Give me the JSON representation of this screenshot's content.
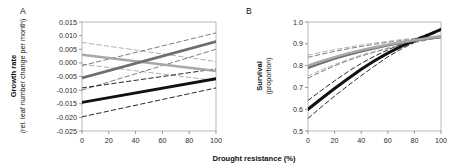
{
  "figure": {
    "width": 454,
    "height": 166,
    "background": "#ffffff",
    "shared_xlabel": "Drought resistance (%)"
  },
  "chart_data": [
    {
      "type": "line",
      "panel": "A",
      "panel_label": "A",
      "title": "",
      "xlabel": "Drought resistance (%)",
      "ylabel": "Growth rate",
      "ylabel_sub": "(rel. leaf number change per month)",
      "xlim": [
        0,
        100
      ],
      "ylim": [
        -0.025,
        0.015
      ],
      "xticks": [
        0,
        20,
        40,
        60,
        80,
        100
      ],
      "yticks": [
        0.015,
        0.01,
        0.005,
        0.0,
        -0.005,
        -0.01,
        -0.015,
        -0.02,
        -0.025
      ],
      "ytick_labels": [
        "0.015",
        "0.010",
        "0.005",
        "0.000",
        "-0.005",
        "-0.010",
        "-0.015",
        "-0.020",
        "-0.025"
      ],
      "xtick_labels": [
        "0",
        "20",
        "40",
        "60",
        "80",
        "100"
      ],
      "grid": false,
      "legend": "none",
      "series": [
        {
          "name": "light-gray-declining",
          "color": "#a8a8a8",
          "style": "solid",
          "width": 2.6,
          "x": [
            0,
            100
          ],
          "values": [
            0.003,
            -0.003
          ]
        },
        {
          "name": "light-gray-ci-upper",
          "color": "#a8a8a8",
          "style": "dashed",
          "width": 0.9,
          "x": [
            0,
            100
          ],
          "values": [
            0.0075,
            0.0005
          ]
        },
        {
          "name": "light-gray-ci-lower",
          "color": "#a8a8a8",
          "style": "dashed",
          "width": 0.9,
          "x": [
            0,
            100
          ],
          "values": [
            -0.0005,
            -0.0065
          ]
        },
        {
          "name": "mid-gray-rising",
          "color": "#6e6e6e",
          "style": "solid",
          "width": 2.8,
          "x": [
            0,
            100
          ],
          "values": [
            -0.0055,
            0.0078
          ]
        },
        {
          "name": "mid-gray-ci-upper",
          "color": "#6e6e6e",
          "style": "dashed",
          "width": 0.9,
          "x": [
            0,
            100
          ],
          "values": [
            -0.001,
            0.011
          ]
        },
        {
          "name": "mid-gray-ci-lower",
          "color": "#6e6e6e",
          "style": "dashed",
          "width": 0.9,
          "x": [
            0,
            100
          ],
          "values": [
            -0.01,
            0.005
          ]
        },
        {
          "name": "black-rising",
          "color": "#111111",
          "style": "solid",
          "width": 2.9,
          "x": [
            0,
            100
          ],
          "values": [
            -0.0145,
            -0.0058
          ]
        },
        {
          "name": "black-ci-upper",
          "color": "#111111",
          "style": "dashed",
          "width": 0.9,
          "x": [
            0,
            100
          ],
          "values": [
            -0.0092,
            -0.0022
          ]
        },
        {
          "name": "black-ci-lower",
          "color": "#111111",
          "style": "dashed",
          "width": 0.9,
          "x": [
            0,
            100
          ],
          "values": [
            -0.0198,
            -0.0092
          ]
        }
      ]
    },
    {
      "type": "line",
      "panel": "B",
      "panel_label": "B",
      "title": "",
      "xlabel": "Drought resistance (%)",
      "ylabel": "Survival",
      "ylabel_sub": "(proportion)",
      "xlim": [
        0,
        100
      ],
      "ylim": [
        0.5,
        1.0
      ],
      "xticks": [
        0,
        20,
        40,
        60,
        80,
        100
      ],
      "yticks": [
        1.0,
        0.9,
        0.8,
        0.7,
        0.6,
        0.5
      ],
      "ytick_labels": [
        "1.0",
        "0.9",
        "0.8",
        "0.7",
        "0.6",
        "0.5"
      ],
      "xtick_labels": [
        "0",
        "20",
        "40",
        "60",
        "80",
        "100"
      ],
      "grid": false,
      "legend": "none",
      "series": [
        {
          "name": "black-curve",
          "color": "#111111",
          "style": "solid",
          "width": 3.0,
          "x": [
            0,
            10,
            20,
            30,
            40,
            50,
            60,
            70,
            80,
            90,
            100
          ],
          "values": [
            0.6,
            0.648,
            0.695,
            0.74,
            0.783,
            0.822,
            0.857,
            0.888,
            0.915,
            0.94,
            0.966
          ]
        },
        {
          "name": "black-ci-upper",
          "color": "#111111",
          "style": "dashed",
          "width": 0.9,
          "x": [
            0,
            10,
            20,
            30,
            40,
            50,
            60,
            70,
            80,
            90,
            100
          ],
          "values": [
            0.64,
            0.686,
            0.73,
            0.772,
            0.81,
            0.843,
            0.872,
            0.899,
            0.922,
            0.944,
            0.968
          ]
        },
        {
          "name": "black-ci-lower",
          "color": "#111111",
          "style": "dashed",
          "width": 0.9,
          "x": [
            0,
            10,
            20,
            30,
            40,
            50,
            60,
            70,
            80,
            90,
            100
          ],
          "values": [
            0.558,
            0.61,
            0.66,
            0.708,
            0.754,
            0.798,
            0.84,
            0.876,
            0.906,
            0.934,
            0.962
          ]
        },
        {
          "name": "mid-gray-curve",
          "color": "#6e6e6e",
          "style": "solid",
          "width": 2.6,
          "x": [
            0,
            10,
            20,
            30,
            40,
            50,
            60,
            70,
            80,
            90,
            100
          ],
          "values": [
            0.79,
            0.812,
            0.832,
            0.85,
            0.866,
            0.88,
            0.893,
            0.905,
            0.915,
            0.924,
            0.932
          ]
        },
        {
          "name": "mid-gray-ci-upper",
          "color": "#6e6e6e",
          "style": "dashed",
          "width": 0.9,
          "x": [
            0,
            10,
            20,
            30,
            40,
            50,
            60,
            70,
            80,
            90,
            100
          ],
          "values": [
            0.838,
            0.852,
            0.865,
            0.877,
            0.888,
            0.898,
            0.907,
            0.915,
            0.922,
            0.929,
            0.936
          ]
        },
        {
          "name": "mid-gray-ci-lower",
          "color": "#6e6e6e",
          "style": "dashed",
          "width": 0.9,
          "x": [
            0,
            10,
            20,
            30,
            40,
            50,
            60,
            70,
            80,
            90,
            100
          ],
          "values": [
            0.742,
            0.772,
            0.799,
            0.823,
            0.844,
            0.862,
            0.878,
            0.893,
            0.906,
            0.918,
            0.929
          ]
        },
        {
          "name": "light-gray-curve",
          "color": "#a8a8a8",
          "style": "solid",
          "width": 2.4,
          "x": [
            0,
            10,
            20,
            30,
            40,
            50,
            60,
            70,
            80,
            90,
            100
          ],
          "values": [
            0.8,
            0.82,
            0.839,
            0.856,
            0.871,
            0.884,
            0.896,
            0.907,
            0.917,
            0.926,
            0.934
          ]
        },
        {
          "name": "light-gray-ci-upper",
          "color": "#a8a8a8",
          "style": "dashed",
          "width": 0.9,
          "x": [
            0,
            10,
            20,
            30,
            40,
            50,
            60,
            70,
            80,
            90,
            100
          ],
          "values": [
            0.848,
            0.861,
            0.873,
            0.884,
            0.894,
            0.903,
            0.911,
            0.919,
            0.925,
            0.932,
            0.938
          ]
        },
        {
          "name": "light-gray-ci-lower",
          "color": "#a8a8a8",
          "style": "dashed",
          "width": 0.9,
          "x": [
            0,
            10,
            20,
            30,
            40,
            50,
            60,
            70,
            80,
            90,
            100
          ],
          "values": [
            0.752,
            0.78,
            0.805,
            0.828,
            0.848,
            0.865,
            0.881,
            0.895,
            0.908,
            0.92,
            0.93
          ]
        }
      ]
    }
  ]
}
